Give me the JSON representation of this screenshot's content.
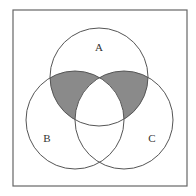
{
  "diagram": {
    "type": "venn",
    "sets": [
      {
        "name": "A",
        "label": "A",
        "cx": 99,
        "cy": 77,
        "r": 49
      },
      {
        "name": "B",
        "label": "B",
        "cx": 75,
        "cy": 120,
        "r": 49
      },
      {
        "name": "C",
        "label": "C",
        "cx": 124,
        "cy": 120,
        "r": 49
      }
    ],
    "shaded_regions": [
      "A∩B only",
      "A∩C only"
    ],
    "colors": {
      "shade": "#8a8a8a",
      "stroke": "#555555",
      "frame": "#666666",
      "background": "#ffffff"
    }
  }
}
